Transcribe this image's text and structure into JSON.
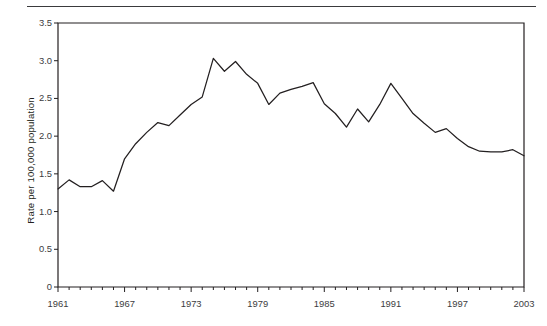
{
  "chart_data": {
    "type": "line",
    "title": "",
    "subtitle": "",
    "xlabel": "",
    "ylabel": "Rate per 100,000 population",
    "xlim": [
      1961,
      2003
    ],
    "ylim": [
      0,
      3.5
    ],
    "grid": false,
    "legend": null,
    "line_color": "#231f20",
    "y_ticks": [
      0,
      0.5,
      1.0,
      1.5,
      2.0,
      2.5,
      3.0,
      3.5
    ],
    "y_tick_labels": [
      "0",
      "0.5",
      "1.0",
      "1.5",
      "2.0",
      "2.5",
      "3.0",
      "3.5"
    ],
    "x_tick_labels": [
      "1961",
      "1967",
      "1973",
      "1979",
      "1985",
      "1991",
      "1997",
      "2003"
    ],
    "x_tick_values": [
      1961,
      1967,
      1973,
      1979,
      1985,
      1991,
      1997,
      2003
    ],
    "x_minor_tick_interval": 1,
    "series": [
      {
        "name": "Rate per 100,000 population",
        "x": [
          1961,
          1962,
          1963,
          1964,
          1965,
          1966,
          1967,
          1968,
          1969,
          1970,
          1971,
          1972,
          1973,
          1974,
          1975,
          1976,
          1977,
          1978,
          1979,
          1980,
          1981,
          1982,
          1983,
          1984,
          1985,
          1986,
          1987,
          1988,
          1989,
          1990,
          1991,
          1992,
          1993,
          1994,
          1995,
          1996,
          1997,
          1998,
          1999,
          2000,
          2001,
          2002,
          2003
        ],
        "values": [
          1.3,
          1.42,
          1.33,
          1.33,
          1.41,
          1.27,
          1.7,
          1.9,
          2.05,
          2.18,
          2.14,
          2.28,
          2.42,
          2.52,
          3.03,
          2.86,
          2.99,
          2.82,
          2.7,
          2.42,
          2.57,
          2.62,
          2.66,
          2.71,
          2.43,
          2.3,
          2.12,
          2.36,
          2.19,
          2.42,
          2.7,
          2.5,
          2.3,
          2.17,
          2.05,
          2.1,
          1.97,
          1.86,
          1.8,
          1.79,
          1.79,
          1.82,
          1.74
        ]
      }
    ]
  },
  "axes": {
    "y_axis_label": "Rate per 100,000 population"
  }
}
